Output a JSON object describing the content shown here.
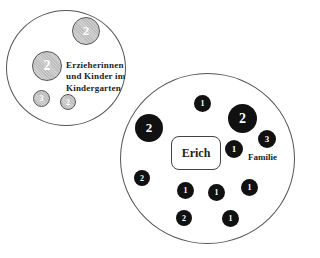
{
  "diagram": {
    "kindergarten": {
      "label_lines": [
        "Erzieherinnen",
        "und Kinder im",
        "Kindergarten"
      ],
      "nodes": [
        {
          "value": "2",
          "x": 72,
          "y": 17,
          "d": 28
        },
        {
          "value": "2",
          "x": 32,
          "y": 51,
          "d": 30
        },
        {
          "value": "3",
          "x": 33,
          "y": 90,
          "d": 17
        },
        {
          "value": "2",
          "x": 60,
          "y": 94,
          "d": 16
        }
      ]
    },
    "family": {
      "label": "Familie",
      "center_label": "Erich",
      "nodes": [
        {
          "value": "1",
          "x": 194,
          "y": 95,
          "d": 17
        },
        {
          "value": "2",
          "x": 135,
          "y": 114,
          "d": 28
        },
        {
          "value": "2",
          "x": 228,
          "y": 104,
          "d": 29
        },
        {
          "value": "1",
          "x": 225,
          "y": 140,
          "d": 18
        },
        {
          "value": "3",
          "x": 258,
          "y": 130,
          "d": 18
        },
        {
          "value": "2",
          "x": 134,
          "y": 170,
          "d": 16
        },
        {
          "value": "1",
          "x": 177,
          "y": 182,
          "d": 17
        },
        {
          "value": "1",
          "x": 208,
          "y": 184,
          "d": 17
        },
        {
          "value": "1",
          "x": 241,
          "y": 179,
          "d": 17
        },
        {
          "value": "2",
          "x": 176,
          "y": 210,
          "d": 16
        },
        {
          "value": "1",
          "x": 222,
          "y": 210,
          "d": 17
        }
      ]
    }
  }
}
